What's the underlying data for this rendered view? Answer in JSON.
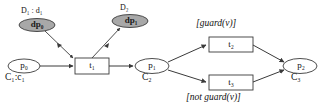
{
  "diagram": {
    "title": "",
    "type": "petri-net",
    "places": [
      {
        "id": "p0",
        "label": "p",
        "sub": "0",
        "capacity_label": "C",
        "capacity_sub": "1",
        "capacity_value": "c",
        "capacity_value_sub": "1",
        "capacity_text": "C₁:c₁"
      },
      {
        "id": "p1",
        "label": "p",
        "sub": "1",
        "capacity_text": "C₂"
      },
      {
        "id": "p2",
        "label": "p",
        "sub": "2",
        "capacity_text": "C₃"
      }
    ],
    "transitions": [
      {
        "id": "t1",
        "label": "t",
        "sub": "1"
      },
      {
        "id": "t2",
        "label": "t",
        "sub": "2"
      },
      {
        "id": "t3",
        "label": "t",
        "sub": "3"
      }
    ],
    "data_places": [
      {
        "id": "dp0",
        "label": "dp",
        "sub": "0",
        "annotation": "D₁ : d₁"
      },
      {
        "id": "dp1",
        "label": "dp",
        "sub": "1",
        "annotation": "D₂"
      }
    ],
    "guards": [
      {
        "id": "guard_true",
        "text_open": "[guard(",
        "text_var": "v",
        "text_close": ")]",
        "full": "[guard(v)]"
      },
      {
        "id": "guard_false",
        "text_open": "[not guard(",
        "text_var": "v",
        "text_close": ")]",
        "full": "[not guard(v)]"
      }
    ],
    "colors": {
      "stroke": "#3a3a3a",
      "data_place_fill": "#a8a8a8",
      "place_fill": "#ffffff",
      "transition_fill": "#ffffff",
      "text": "#111111",
      "background": "#ffffff"
    },
    "labels": {
      "p0_name": "p₀",
      "p1_name": "p₁",
      "p2_name": "p₂",
      "t1_name": "t₁",
      "t2_name": "t₂",
      "t3_name": "t₃",
      "dp0_name": "dp₀",
      "dp1_name": "dp₁",
      "d1_annotation": "D₁ : d₁",
      "d2_annotation": "D₂",
      "c1_capacity": "C₁:c₁",
      "c2_capacity": "C₂",
      "c3_capacity": "C₃",
      "guard_true": "[guard(v)]",
      "guard_false": "[not guard(v)]"
    }
  }
}
